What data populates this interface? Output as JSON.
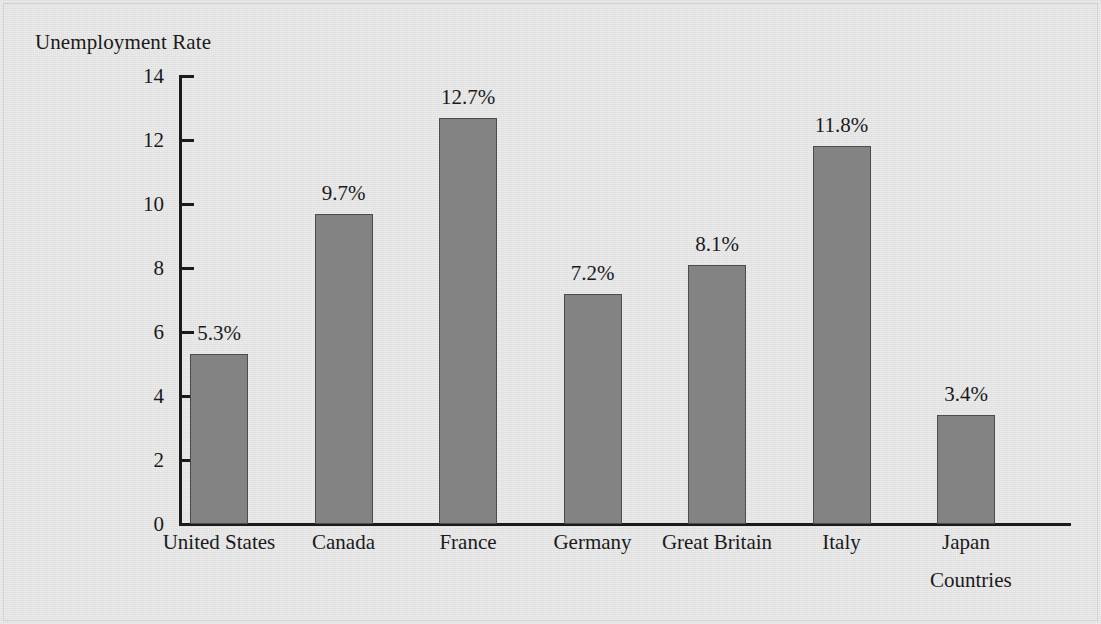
{
  "chart_data": {
    "type": "bar",
    "title": "",
    "ylabel": "Unemployment Rate",
    "xlabel": "Countries",
    "categories": [
      "United States",
      "Canada",
      "France",
      "Germany",
      "Great Britain",
      "Italy",
      "Japan"
    ],
    "values": [
      5.3,
      9.7,
      12.7,
      7.2,
      8.1,
      11.8,
      3.4
    ],
    "value_labels": [
      "5.3%",
      "9.7%",
      "12.7%",
      "7.2%",
      "8.1%",
      "11.8%",
      "3.4%"
    ],
    "ylim": [
      0,
      14
    ],
    "ytick_labels": [
      "14",
      "12",
      "10",
      "8",
      "6",
      "4",
      "2",
      "0"
    ],
    "ytick_values": [
      14,
      12,
      10,
      8,
      6,
      4,
      2,
      0
    ],
    "ytick_step": 2,
    "grid": false,
    "legend": "none",
    "bar_color": "#838383",
    "bar_outline_color": "#4c4c4c",
    "axis_color": "#1b1b1b",
    "background_color": "#e4e4e4",
    "text_color": "#1a1a1a"
  }
}
